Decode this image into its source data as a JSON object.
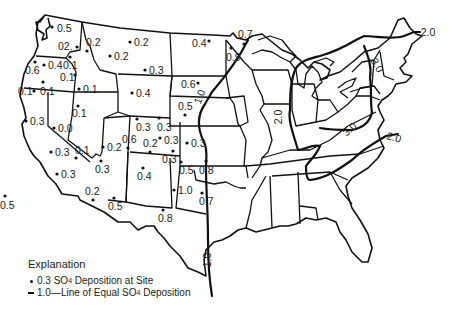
{
  "map": {
    "region": "Contiguous United States",
    "subject": "SO4 Deposition"
  },
  "sites": [
    {
      "value": "0.5",
      "x": 52,
      "y": 27,
      "lx": 57,
      "ly": 32
    },
    {
      "value": "02.",
      "x": 77,
      "y": 47,
      "lx": 58,
      "ly": 50
    },
    {
      "value": "0.2",
      "x": 87,
      "y": 51,
      "lx": 86,
      "ly": 46
    },
    {
      "value": "0.2",
      "x": 130,
      "y": 42,
      "lx": 134,
      "ly": 46
    },
    {
      "value": "0.2",
      "x": 110,
      "y": 56,
      "lx": 114,
      "ly": 60
    },
    {
      "value": "0.6",
      "x": 35,
      "y": 62,
      "lx": 25,
      "ly": 74
    },
    {
      "value": "0.4",
      "x": 44,
      "y": 65,
      "lx": 48,
      "ly": 69
    },
    {
      "value": "0.1",
      "x": 70,
      "y": 57,
      "lx": 63,
      "ly": 69
    },
    {
      "value": "0.1",
      "x": 75,
      "y": 75,
      "lx": 60,
      "ly": 81
    },
    {
      "value": "0.1",
      "x": 43,
      "y": 82,
      "lx": 40,
      "ly": 95
    },
    {
      "value": "0.1",
      "x": 34,
      "y": 91,
      "lx": 18,
      "ly": 95
    },
    {
      "value": "0.1",
      "x": 79,
      "y": 89,
      "lx": 83,
      "ly": 93
    },
    {
      "value": "0.3",
      "x": 145,
      "y": 70,
      "lx": 149,
      "ly": 74
    },
    {
      "value": "0.4",
      "x": 132,
      "y": 93,
      "lx": 136,
      "ly": 97
    },
    {
      "value": "0.4",
      "x": 209,
      "y": 41,
      "lx": 192,
      "ly": 47
    },
    {
      "value": "0.7",
      "x": 244,
      "y": 44,
      "lx": 238,
      "ly": 38
    },
    {
      "value": "0.9",
      "x": 231,
      "y": 48,
      "lx": 226,
      "ly": 61
    },
    {
      "value": "0.6",
      "x": 198,
      "y": 83,
      "lx": 181,
      "ly": 88
    },
    {
      "value": "0.5",
      "x": 185,
      "y": 115,
      "lx": 178,
      "ly": 110
    },
    {
      "value": "0.1",
      "x": 78,
      "y": 106,
      "lx": 72,
      "ly": 117
    },
    {
      "value": "0.3",
      "x": 26,
      "y": 121,
      "lx": 30,
      "ly": 125
    },
    {
      "value": "0.0",
      "x": 54,
      "y": 128,
      "lx": 58,
      "ly": 132
    },
    {
      "value": "0.3",
      "x": 137,
      "y": 119,
      "lx": 136,
      "ly": 131
    },
    {
      "value": "0.3",
      "x": 159,
      "y": 118,
      "lx": 157,
      "ly": 131
    },
    {
      "value": "0.6",
      "x": 128,
      "y": 148,
      "lx": 122,
      "ly": 143
    },
    {
      "value": "0.3",
      "x": 160,
      "y": 138,
      "lx": 164,
      "ly": 144
    },
    {
      "value": "0.2",
      "x": 150,
      "y": 152,
      "lx": 143,
      "ly": 147
    },
    {
      "value": "0.3",
      "x": 187,
      "y": 143,
      "lx": 191,
      "ly": 147
    },
    {
      "value": "0.3",
      "x": 173,
      "y": 151,
      "lx": 162,
      "ly": 163
    },
    {
      "value": "0.2",
      "x": 103,
      "y": 147,
      "lx": 107,
      "ly": 151
    },
    {
      "value": "0.3",
      "x": 51,
      "y": 152,
      "lx": 55,
      "ly": 156
    },
    {
      "value": "0.1",
      "x": 76,
      "y": 158,
      "lx": 75,
      "ly": 154
    },
    {
      "value": "0.3",
      "x": 101,
      "y": 161,
      "lx": 95,
      "ly": 173
    },
    {
      "value": "0.4",
      "x": 143,
      "y": 168,
      "lx": 137,
      "ly": 180
    },
    {
      "value": "0.3",
      "x": 57,
      "y": 174,
      "lx": 61,
      "ly": 178
    },
    {
      "value": "0.5",
      "x": 181,
      "y": 162,
      "lx": 179,
      "ly": 174
    },
    {
      "value": "0.8",
      "x": 206,
      "y": 161,
      "lx": 199,
      "ly": 174
    },
    {
      "value": "1.0",
      "x": 174,
      "y": 190,
      "lx": 178,
      "ly": 194
    },
    {
      "value": "0.7",
      "x": 202,
      "y": 193,
      "lx": 199,
      "ly": 205
    },
    {
      "value": "0.2",
      "x": 93,
      "y": 200,
      "lx": 85,
      "ly": 195
    },
    {
      "value": "0.5",
      "x": 114,
      "y": 198,
      "lx": 108,
      "ly": 210
    },
    {
      "value": "0.5",
      "x": 5,
      "y": 196,
      "lx": 0,
      "ly": 209
    },
    {
      "value": "0.8",
      "x": 163,
      "y": 210,
      "lx": 158,
      "ly": 222
    }
  ],
  "isolines": [
    {
      "value": "1.0",
      "x": 203,
      "y": 98,
      "rotate": -70
    },
    {
      "value": "1.0",
      "x": 211,
      "y": 260,
      "rotate": -90
    },
    {
      "value": "2.0",
      "x": 282,
      "y": 117,
      "rotate": -90
    },
    {
      "value": "3.0",
      "x": 374,
      "y": 67,
      "rotate": 60
    },
    {
      "value": "3.0",
      "x": 352,
      "y": 132,
      "rotate": -40
    },
    {
      "value": "2.0",
      "x": 428,
      "y": 36,
      "rotate": 0
    },
    {
      "value": "2.0",
      "x": 393,
      "y": 141,
      "rotate": 15
    }
  ],
  "legend": {
    "title": "Explanation",
    "site_value": "0.3",
    "site_text_pre": "SO",
    "site_sub": "4",
    "site_text_post": " Deposition at Site",
    "line_value": "1.0",
    "line_text_pre": "—Line of Equal SO",
    "line_sub": "4",
    "line_text_post": " Deposition"
  }
}
